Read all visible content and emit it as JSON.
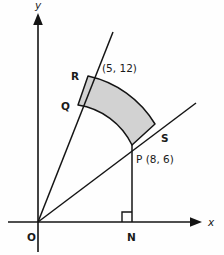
{
  "figure": {
    "background_color": "#fefefe",
    "line_color": "#141414",
    "shade_color": "#d2d2d2",
    "shade_stroke": "#141414"
  },
  "axes": {
    "x_label": "x",
    "y_label": "y",
    "origin_label": "O",
    "x_axis": {
      "start_x": 8,
      "end_x": 202,
      "y": 222
    },
    "y_axis": {
      "x": 38,
      "start_y": 252,
      "end_y": 14
    }
  },
  "points": [
    {
      "name": "O",
      "label": "O",
      "x": 38,
      "y": 222,
      "label_x": 27,
      "label_y": 238
    },
    {
      "name": "N",
      "label": "N",
      "x": 132,
      "y": 222,
      "label_x": 128,
      "label_y": 238
    },
    {
      "name": "P",
      "label": "P (8, 6)",
      "x": 132,
      "y": 145,
      "label_x": 136,
      "label_y": 160
    },
    {
      "name": "Q",
      "label": "Q",
      "x": 78,
      "y": 105,
      "label_x": 62,
      "label_y": 108
    },
    {
      "name": "R",
      "label": "R",
      "x": 88,
      "y": 76,
      "label_x": 72,
      "label_y": 76
    },
    {
      "name": "S",
      "label": "S",
      "x": 155,
      "y": 124,
      "label_x": 162,
      "label_y": 139
    },
    {
      "name": "R-coordinate",
      "label": "(5, 12)",
      "x": 88,
      "y": 76,
      "label_x": 103,
      "label_y": 69
    }
  ],
  "rays": [
    {
      "name": "ray-OR",
      "from": "O",
      "to_x": 113,
      "to_y": 32
    },
    {
      "name": "ray-OS",
      "from": "O",
      "to_x": 196,
      "to_y": 103
    }
  ],
  "segments": [
    {
      "name": "segment-PN",
      "x1": 132,
      "y1": 145,
      "x2": 132,
      "y2": 222
    }
  ],
  "right_angle": {
    "at": "N",
    "size": 9,
    "x": 132,
    "y": 222
  },
  "shaded_region": {
    "name": "annular-sector-QRSP",
    "vertices": [
      "Q",
      "R",
      "S",
      "P"
    ],
    "fill": "#d2d2d2",
    "path": "M 88 76 A 104 104 0 0 1 155 124 L 132 145 A 72 72 0 0 0 78 105 Z"
  },
  "coordinate_labels": {
    "R_point": "(5, 12)",
    "P_point": "P (8, 6)"
  }
}
